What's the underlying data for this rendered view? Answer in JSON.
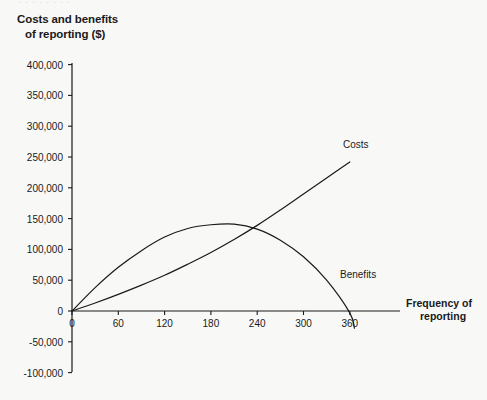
{
  "page": {
    "background_color": "#f8f8f7",
    "ink_color": "#1a1a1a",
    "bleed_through_text": "· · ·  ·  ·  · ·   ·"
  },
  "chart_title": {
    "line1": "Costs and benefits",
    "line2": "of reporting ($)"
  },
  "axis_titles": {
    "x_line1": "Frequency of",
    "x_line2": "reporting"
  },
  "series_labels": {
    "costs": "Costs",
    "benefits": "Benefits"
  },
  "chart_data": {
    "type": "line",
    "title": "Costs and benefits of reporting ($)",
    "xlabel": "Frequency of reporting",
    "ylabel": "Costs and benefits of reporting ($)",
    "xlim": [
      0,
      390
    ],
    "ylim": [
      -100000,
      400000
    ],
    "grid": false,
    "legend_position": "inline-annotation",
    "x_ticks": [
      0,
      60,
      120,
      180,
      240,
      300,
      360
    ],
    "x_tick_labels": [
      "0",
      "60",
      "120",
      "180",
      "240",
      "300",
      "360"
    ],
    "y_ticks": [
      -100000,
      -50000,
      0,
      50000,
      100000,
      150000,
      200000,
      250000,
      300000,
      350000,
      400000
    ],
    "y_tick_labels": [
      "-100,000",
      "-50,000",
      "0",
      "50,000",
      "100,000",
      "150,000",
      "200,000",
      "250,000",
      "300,000",
      "350,000",
      "400,000"
    ],
    "series": [
      {
        "name": "Costs",
        "note": "gently convex increasing curve from the origin",
        "x": [
          0,
          30,
          60,
          90,
          120,
          150,
          180,
          210,
          240,
          270,
          300,
          330,
          360
        ],
        "values": [
          0,
          13000,
          27000,
          42000,
          58000,
          76000,
          95000,
          116000,
          139000,
          164000,
          190000,
          216000,
          242000
        ]
      },
      {
        "name": "Benefits",
        "note": "concave parabola peaking near x=210 then falling through zero near x=357",
        "x": [
          0,
          30,
          60,
          90,
          120,
          150,
          180,
          210,
          240,
          270,
          300,
          330,
          360,
          366
        ],
        "values": [
          0,
          38000,
          71000,
          98000,
          120000,
          134000,
          140000,
          141000,
          133000,
          115000,
          88000,
          50000,
          -3000,
          -28000
        ]
      }
    ],
    "annotations": [
      {
        "text": "Costs",
        "x": 328,
        "y": 253000
      },
      {
        "text": "Benefits",
        "x": 300,
        "y": 55000
      }
    ],
    "intersection": {
      "x": 247,
      "y": 135000
    }
  }
}
